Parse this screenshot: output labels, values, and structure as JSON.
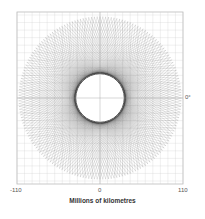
{
  "chart_data": {
    "type": "line",
    "title": "",
    "xlabel": "Millions of kilometres",
    "ylabel": "",
    "xlim": [
      -110,
      110
    ],
    "ylim": [
      -110,
      110
    ],
    "x_ticks": [
      "-110",
      "0",
      "110"
    ],
    "annotations": [
      {
        "text": "0°",
        "position": "right of frame at y=0"
      }
    ],
    "grid": true,
    "outer_radius": 108,
    "inner_radius": 33,
    "num_lines": 180,
    "line_color": "#000000",
    "line_opacity": 0.28,
    "frame_color": "#bbbbbb",
    "grid_color": "#cccccc"
  },
  "labels": {
    "tick_left": "-110",
    "tick_center": "0",
    "tick_right": "110",
    "xlabel": "Millions of kilometres",
    "angle_marker": "0°"
  }
}
